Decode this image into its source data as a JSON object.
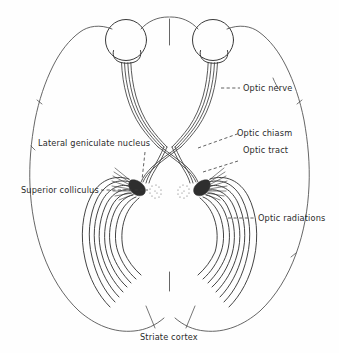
{
  "figure": {
    "background_color": "#fefefe",
    "ink_color": "#3a3a3a",
    "text_color": "#2b2b2b"
  },
  "labels": {
    "optic_nerve": "Optic nerve",
    "optic_chiasm": "Optic chiasm",
    "optic_tract": "Optic tract",
    "optic_radiations": "Optic radiations",
    "lateral_geniculate_nucleus": "Lateral geniculate nucleus",
    "superior_colliculus": "Superior colliculus",
    "striate_cortex": "Striate cortex"
  },
  "structures": [
    {
      "name": "left-eye",
      "kind": "eyeball"
    },
    {
      "name": "right-eye",
      "kind": "eyeball"
    },
    {
      "name": "optic-chiasm",
      "kind": "crossing"
    },
    {
      "name": "left-lateral-geniculate-nucleus",
      "kind": "nucleus"
    },
    {
      "name": "right-lateral-geniculate-nucleus",
      "kind": "nucleus"
    },
    {
      "name": "left-superior-colliculus",
      "kind": "stippled-nucleus"
    },
    {
      "name": "right-superior-colliculus",
      "kind": "stippled-nucleus"
    },
    {
      "name": "left-optic-radiation",
      "kind": "fiber-fan"
    },
    {
      "name": "right-optic-radiation",
      "kind": "fiber-fan"
    },
    {
      "name": "left-striate-cortex",
      "kind": "cortex"
    },
    {
      "name": "right-striate-cortex",
      "kind": "cortex"
    }
  ]
}
